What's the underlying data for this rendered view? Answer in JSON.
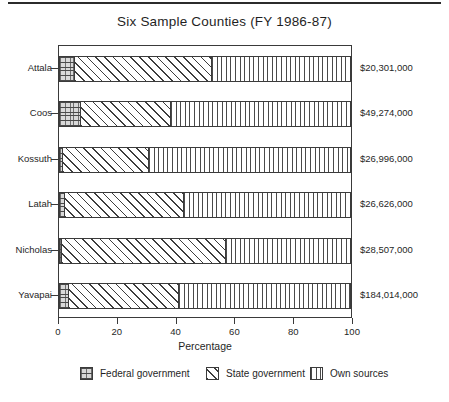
{
  "chart_data": {
    "type": "bar",
    "orientation": "horizontal",
    "stacked": true,
    "title": "Six Sample Counties (FY 1986-87)",
    "xlabel": "Percentage",
    "ylabel": "",
    "xlim": [
      0,
      100
    ],
    "xticks": [
      0,
      20,
      40,
      60,
      80,
      100
    ],
    "xtick_labels": [
      "0",
      "20",
      "40",
      "60",
      "80",
      "100"
    ],
    "grid": false,
    "legend_position": "bottom",
    "categories": [
      "Attala",
      "Coos",
      "Kossuth",
      "Latah",
      "Nicholas",
      "Yavapai"
    ],
    "series": [
      {
        "name": "Federal government",
        "pattern": "cross-hatch",
        "values": [
          5.5,
          7.5,
          1.5,
          2.0,
          1.0,
          3.5
        ]
      },
      {
        "name": "State government",
        "pattern": "diagonal-hatch",
        "values": [
          47.0,
          31.0,
          29.5,
          41.0,
          56.0,
          37.5
        ]
      },
      {
        "name": "Own sources",
        "pattern": "vertical-hatch",
        "values": [
          47.5,
          61.5,
          69.0,
          57.0,
          43.0,
          59.0
        ]
      }
    ],
    "value_labels": [
      "$20,301,000",
      "$49,274,000",
      "$26,996,000",
      "$26,626,000",
      "$28,507,000",
      "$184,014,000"
    ],
    "colors": {
      "federal": "#d9d9d9",
      "state": "#ffffff",
      "own_sources": "#ffffff",
      "outline": "#3b3b3b",
      "text": "#1f1f1f"
    }
  },
  "legend": {
    "items": [
      {
        "label": "Federal government"
      },
      {
        "label": "State government"
      },
      {
        "label": "Own sources"
      }
    ]
  }
}
